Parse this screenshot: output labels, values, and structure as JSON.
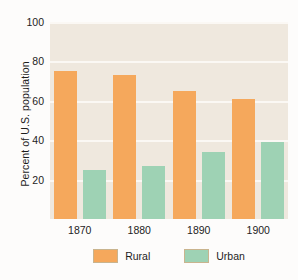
{
  "chart_data": {
    "type": "bar",
    "title": "",
    "xlabel": "",
    "ylabel": "Percent of U.S. population",
    "categories": [
      "1870",
      "1880",
      "1890",
      "1900"
    ],
    "series": [
      {
        "name": "Rural",
        "color": "#f5a85c",
        "values": [
          75,
          73,
          65,
          61
        ]
      },
      {
        "name": "Urban",
        "color": "#9ed2b4",
        "values": [
          25,
          27,
          34,
          39
        ]
      }
    ],
    "ylim": [
      0,
      100
    ],
    "yticks": [
      20,
      40,
      60,
      80,
      100
    ],
    "ytick_labels": [
      "20",
      "40",
      "60",
      "80",
      "100"
    ],
    "grid": true,
    "legend_position": "bottom",
    "plot_background": "#efe8de",
    "gridline_color": "#fbf8f4",
    "page_background": "#fdfcfb"
  },
  "axis": {
    "y_title": "Percent of U.S. population",
    "y_ticks": [
      {
        "label": "100",
        "value": 100
      },
      {
        "label": "80",
        "value": 80
      },
      {
        "label": "60",
        "value": 60
      },
      {
        "label": "40",
        "value": 40
      },
      {
        "label": "20",
        "value": 20
      }
    ],
    "x_ticks": [
      {
        "label": "1870"
      },
      {
        "label": "1880"
      },
      {
        "label": "1890"
      },
      {
        "label": "1900"
      }
    ]
  },
  "legend": {
    "items": [
      {
        "label": "Rural",
        "color": "#f5a85c"
      },
      {
        "label": "Urban",
        "color": "#9ed2b4"
      }
    ]
  }
}
